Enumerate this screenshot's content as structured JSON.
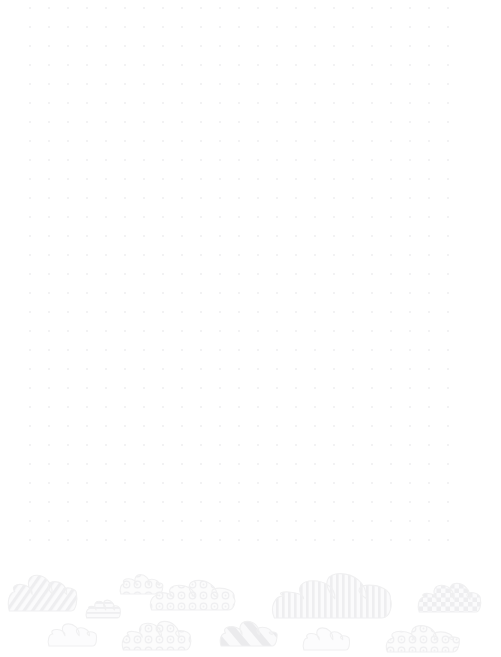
{
  "page": {
    "kind": "dot-grid-notebook-page",
    "width": 501,
    "height": 657,
    "background_color": "#ffffff",
    "title": ""
  },
  "dot_grid": {
    "dot_color": "#efeff1",
    "dot_radius": 1.05,
    "spacing_x": 19,
    "spacing_y": 19,
    "origin_x": 30,
    "origin_y": 8,
    "columns": 23,
    "rows": 29
  },
  "cloud_border": {
    "outline_color": "#f0f0f1",
    "fill_color": "#fafafa",
    "pattern_color": "#f1f1f2",
    "band_top": 557,
    "band_height": 100,
    "clouds": [
      {
        "name": "cloud-diagonal-stripe-left",
        "pattern": "diagonal-stripes",
        "x": 8,
        "y": 569,
        "w": 68,
        "h": 42
      },
      {
        "name": "cloud-horizontal-line-small",
        "pattern": "horizontal-lines",
        "x": 86,
        "y": 598,
        "w": 34,
        "h": 20
      },
      {
        "name": "cloud-bubble-small-top",
        "pattern": "bubbles",
        "x": 120,
        "y": 572,
        "w": 42,
        "h": 22
      },
      {
        "name": "cloud-bubble-wide",
        "pattern": "bubbles",
        "x": 150,
        "y": 578,
        "w": 84,
        "h": 32
      },
      {
        "name": "cloud-plain-lower-left",
        "pattern": "plain",
        "x": 48,
        "y": 620,
        "w": 48,
        "h": 26
      },
      {
        "name": "cloud-bubble-lower-left",
        "pattern": "bubbles",
        "x": 122,
        "y": 618,
        "w": 68,
        "h": 32
      },
      {
        "name": "cloud-diagonal-band-center",
        "pattern": "diagonal-bands",
        "x": 220,
        "y": 618,
        "w": 56,
        "h": 28
      },
      {
        "name": "cloud-vertical-stripe-large",
        "pattern": "vertical-stripes",
        "x": 272,
        "y": 570,
        "w": 118,
        "h": 48
      },
      {
        "name": "cloud-plain-lower-center",
        "pattern": "plain",
        "x": 303,
        "y": 624,
        "w": 46,
        "h": 26
      },
      {
        "name": "cloud-checker-right",
        "pattern": "checker",
        "x": 418,
        "y": 580,
        "w": 62,
        "h": 32
      },
      {
        "name": "cloud-bubble-lower-right",
        "pattern": "bubbles",
        "x": 386,
        "y": 622,
        "w": 72,
        "h": 30
      }
    ]
  }
}
